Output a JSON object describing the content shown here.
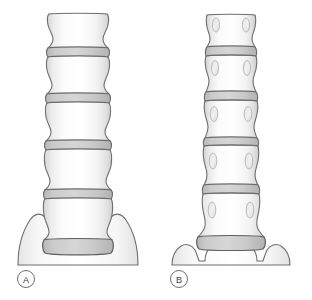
{
  "figure": {
    "background_color": "#ffffff",
    "width": 312,
    "height": 300
  },
  "style_colors": {
    "outline": "#6e6e6e",
    "outline_dark": "#5a5a5a",
    "vertebra_fill_light": "#ffffff",
    "vertebra_fill_shade": "#e9e9e9",
    "vertebra_edge_shade": "#d2d2d2",
    "disc_fill": "#c9c9c9",
    "disc_fill_light": "#d8d8d8",
    "disc_outline": "#6b6b6b",
    "sacrum_fill": "#fbfbfb",
    "sacrum_shade": "#ededed",
    "pedicle_fill": "#ededed",
    "pedicle_outline": "#b4b4b4",
    "label_text": "#3a3a3a",
    "label_ring": "#6e6e6e"
  },
  "panels": [
    {
      "id": "panel-a",
      "label": "A",
      "view_name": "lateral-view",
      "center_x": 78,
      "column_top": 13,
      "vertebra_count": 5,
      "disc_count": 5,
      "has_pedicle_ovals": false,
      "sacrum_left": 18,
      "sacrum_right": 138,
      "label_cx": 26,
      "label_cy": 279,
      "vertebrae": [
        {
          "name": "L1",
          "top": 13,
          "bottom": 49,
          "half_width": 30,
          "waist": 25
        },
        {
          "name": "L2",
          "top": 57,
          "bottom": 95,
          "half_width": 31,
          "waist": 25
        },
        {
          "name": "L3",
          "top": 103,
          "bottom": 142,
          "half_width": 32,
          "waist": 26
        },
        {
          "name": "L4",
          "top": 150,
          "bottom": 190,
          "half_width": 33,
          "waist": 27
        },
        {
          "name": "L5",
          "top": 198,
          "bottom": 236,
          "half_width": 34,
          "waist": 29
        }
      ],
      "discs": [
        {
          "name": "L1-L2",
          "top": 49,
          "bottom": 57,
          "half_width": 30
        },
        {
          "name": "L2-L3",
          "top": 95,
          "bottom": 103,
          "half_width": 31
        },
        {
          "name": "L3-L4",
          "top": 142,
          "bottom": 150,
          "half_width": 32
        },
        {
          "name": "L4-L5",
          "top": 190,
          "bottom": 198,
          "half_width": 33
        },
        {
          "name": "L5-S1",
          "top": 236,
          "bottom": 246,
          "half_width": 34
        }
      ]
    },
    {
      "id": "panel-b",
      "label": "B",
      "view_name": "anteroposterior-view",
      "center_x": 231,
      "column_top": 14,
      "vertebra_count": 5,
      "disc_count": 5,
      "has_pedicle_ovals": true,
      "sacrum_left": 172,
      "sacrum_right": 296,
      "label_cx": 179,
      "label_cy": 279,
      "vertebrae": [
        {
          "name": "L1",
          "top": 14,
          "bottom": 48,
          "half_width": 23,
          "waist": 20
        },
        {
          "name": "L2",
          "top": 56,
          "bottom": 93,
          "half_width": 24,
          "waist": 20
        },
        {
          "name": "L3",
          "top": 101,
          "bottom": 139,
          "half_width": 25,
          "waist": 21
        },
        {
          "name": "L4",
          "top": 146,
          "bottom": 186,
          "half_width": 26,
          "waist": 22
        },
        {
          "name": "L5",
          "top": 194,
          "bottom": 234,
          "half_width": 27,
          "waist": 23
        }
      ],
      "discs": [
        {
          "name": "L1-L2",
          "top": 48,
          "bottom": 56,
          "half_width": 24
        },
        {
          "name": "L2-L3",
          "top": 93,
          "bottom": 101,
          "half_width": 25
        },
        {
          "name": "L3-L4",
          "top": 139,
          "bottom": 146,
          "half_width": 26
        },
        {
          "name": "L4-L5",
          "top": 186,
          "bottom": 194,
          "half_width": 27
        },
        {
          "name": "L5-S1",
          "top": 234,
          "bottom": 245,
          "half_width": 28
        }
      ]
    }
  ]
}
